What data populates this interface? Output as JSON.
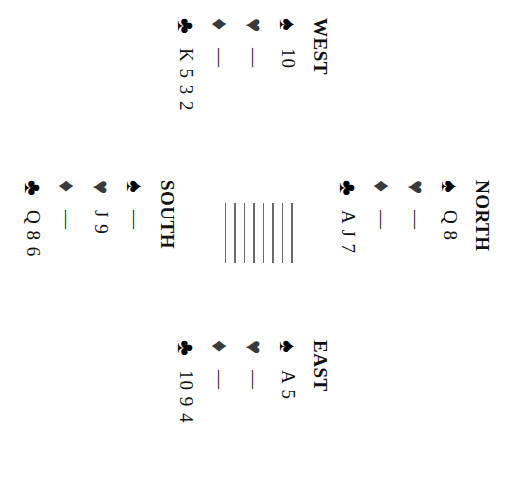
{
  "diagram": {
    "orientation": "rotated 90 degrees clockwise",
    "hands": {
      "north": {
        "label": "NORTH",
        "spades": "Q 8",
        "hearts": "—",
        "diamonds": "—",
        "clubs": "A J 7"
      },
      "west": {
        "label": "WEST",
        "spades": "10",
        "hearts": "—",
        "diamonds": "—",
        "clubs": "K 5 3 2"
      },
      "east": {
        "label": "EAST",
        "spades": "A 5",
        "hearts": "—",
        "diamonds": "—",
        "clubs": "10 9 4"
      },
      "south": {
        "label": "SOUTH",
        "spades": "—",
        "hearts": "J 9",
        "diamonds": "—",
        "clubs": "Q 8 6"
      }
    },
    "suit_symbols": {
      "spades": "♠",
      "hearts": "♥",
      "diamonds": "♦",
      "clubs": "♣"
    },
    "suit_icons": {
      "spades": "spade-icon",
      "hearts": "heart-icon",
      "diamonds": "diamond-icon",
      "clubs": "club-icon"
    },
    "center_table_lines": 8
  }
}
